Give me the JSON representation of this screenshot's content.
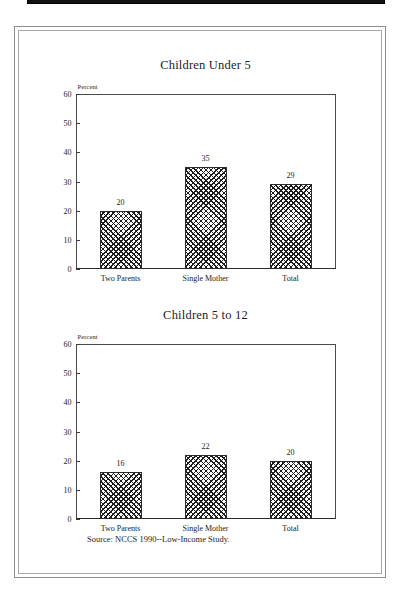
{
  "document": {
    "background_color": "#ffffff",
    "frame_color": "#8d8d8d",
    "top_bar_color": "#111111"
  },
  "source_note": "Source:  NCCS 1990--Low-Income Study.",
  "charts": [
    {
      "id": "children-under-5",
      "title": "Children Under 5",
      "axis_unit": "Percent"
    },
    {
      "id": "children-5-to-12",
      "title": "Children 5 to 12",
      "axis_unit": "Percent"
    }
  ],
  "chart_data": [
    {
      "type": "bar",
      "title": "Children Under 5",
      "categories": [
        "Two Parents",
        "Single Mother",
        "Total"
      ],
      "values": [
        20,
        35,
        29
      ],
      "xlabel": "",
      "ylabel": "Percent",
      "ylim": [
        0,
        60
      ],
      "yticks": [
        0,
        10,
        20,
        30,
        40,
        50,
        60
      ],
      "grid": false,
      "legend": "none",
      "bar_fill": "crosshatch",
      "data_labels": [
        "20",
        "35",
        "29"
      ],
      "source": "Source:  NCCS 1990--Low-Income Study."
    },
    {
      "type": "bar",
      "title": "Children 5 to 12",
      "categories": [
        "Two Parents",
        "Single Mother",
        "Total"
      ],
      "values": [
        16,
        22,
        20
      ],
      "xlabel": "",
      "ylabel": "Percent",
      "ylim": [
        0,
        60
      ],
      "yticks": [
        0,
        10,
        20,
        30,
        40,
        50,
        60
      ],
      "grid": false,
      "legend": "none",
      "bar_fill": "crosshatch",
      "data_labels": [
        "16",
        "22",
        "20"
      ],
      "source": "Source:  NCCS 1990--Low-Income Study."
    }
  ]
}
